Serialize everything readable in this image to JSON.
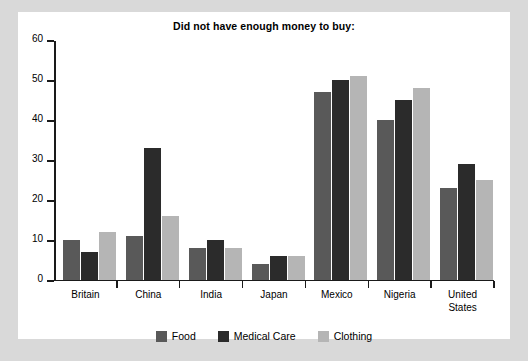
{
  "chart_data": {
    "type": "bar",
    "title": "Did not have enough money to buy:",
    "xlabel": "",
    "ylabel": "",
    "ylim": [
      0,
      60
    ],
    "yticks": [
      0,
      10,
      20,
      30,
      40,
      50,
      60
    ],
    "grid": false,
    "legend_position": "bottom",
    "categories": [
      "Britain",
      "China",
      "India",
      "Japan",
      "Mexico",
      "Nigeria",
      "United\nStates"
    ],
    "series": [
      {
        "name": "Food",
        "color": "#595959",
        "values": [
          10,
          11,
          8,
          4,
          47,
          40,
          23
        ]
      },
      {
        "name": "Medical Care",
        "color": "#2b2b2b",
        "values": [
          7,
          33,
          10,
          6,
          50,
          45,
          29
        ]
      },
      {
        "name": "Clothing",
        "color": "#b5b5b5",
        "values": [
          12,
          16,
          8,
          6,
          51,
          48,
          25
        ]
      }
    ]
  },
  "figure": {
    "background": "#ffffff",
    "page_background": "#d9d9d9",
    "axis_color": "#1a1a1a"
  }
}
